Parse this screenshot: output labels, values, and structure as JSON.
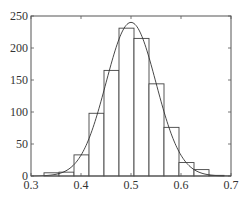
{
  "chart_data": {
    "type": "bar",
    "subtype": "histogram-with-normal-fit",
    "title": "",
    "xlabel": "",
    "ylabel": "",
    "xlim": [
      0.3,
      0.7
    ],
    "ylim": [
      0,
      250
    ],
    "xticks": [
      0.3,
      0.4,
      0.5,
      0.6,
      0.7
    ],
    "xtick_labels": [
      "0.3",
      "0.4",
      "0.5",
      "0.6",
      "0.7"
    ],
    "yticks": [
      0,
      50,
      100,
      150,
      200,
      250
    ],
    "ytick_labels": [
      "0",
      "50",
      "100",
      "150",
      "200",
      "250"
    ],
    "grid": false,
    "legend": "none",
    "bin_edges": [
      0.326,
      0.356,
      0.386,
      0.416,
      0.446,
      0.476,
      0.506,
      0.536,
      0.566,
      0.596,
      0.626,
      0.656,
      0.686
    ],
    "values": [
      5,
      6,
      33,
      98,
      165,
      231,
      215,
      144,
      76,
      21,
      10,
      1
    ],
    "fit_curve": {
      "type": "normal",
      "mean": 0.5,
      "peak": 240,
      "sigma": 0.05
    },
    "colors": {
      "bar_fill": "#ffffff",
      "bar_edge": "#444444",
      "curve": "#333333",
      "axis": "#555555"
    }
  }
}
